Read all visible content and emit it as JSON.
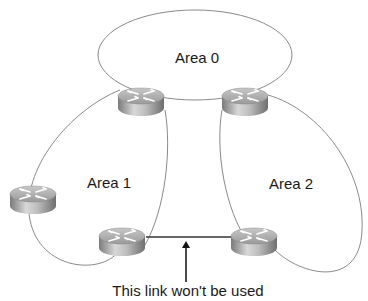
{
  "diagram": {
    "type": "ospf-area-topology",
    "areas": [
      {
        "id": "area0",
        "label": "Area 0"
      },
      {
        "id": "area1",
        "label": "Area 1"
      },
      {
        "id": "area2",
        "label": "Area 2"
      }
    ],
    "routers": [
      {
        "id": "r-top-left",
        "icon": "router-icon",
        "areas": [
          "Area 0",
          "Area 1"
        ]
      },
      {
        "id": "r-top-right",
        "icon": "router-icon",
        "areas": [
          "Area 0",
          "Area 2"
        ]
      },
      {
        "id": "r-left",
        "icon": "router-icon",
        "areas": [
          "Area 1"
        ]
      },
      {
        "id": "r-bottom-left",
        "icon": "router-icon",
        "areas": [
          "Area 1"
        ]
      },
      {
        "id": "r-bottom-right",
        "icon": "router-icon",
        "areas": [
          "Area 2"
        ]
      }
    ],
    "links": [
      {
        "from": "r-bottom-left",
        "to": "r-bottom-right",
        "note": "This link won't be used"
      }
    ],
    "annotation": {
      "text": "This link won't be used",
      "points_to": "link between r-bottom-left and r-bottom-right"
    },
    "colors": {
      "outline": "#8a8a8a",
      "link": "#333333",
      "text": "#1a1a1a"
    }
  }
}
